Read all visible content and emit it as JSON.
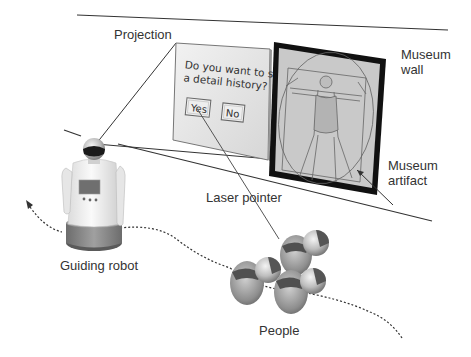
{
  "labels": {
    "projection": "Projection",
    "museum_wall": "Museum\nwall",
    "museum_artifact": "Museum\nartifact",
    "laser_pointer": "Laser pointer",
    "guiding_robot": "Guiding robot",
    "people": "People"
  },
  "dialog": {
    "question_line1": "Do you want to see",
    "question_line2": "a detail history?",
    "yes_label": "Yes",
    "no_label": "No"
  },
  "artifact": {
    "icon": "vitruvian-man-drawing"
  },
  "colors": {
    "line": "#333333",
    "frame": "#111111",
    "dialog_bg": "#e4e4e4",
    "artwork_bg": "#c8c8c8",
    "robot_base": "#8a8a8a",
    "people_body": "#8c8c8c"
  }
}
